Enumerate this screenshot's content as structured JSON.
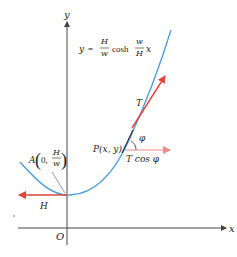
{
  "figure": {
    "type": "catenary-tension-diagram",
    "axes": {
      "x_label": "x",
      "y_label": "y",
      "origin_label": "O"
    },
    "equation": {
      "lhs": "y",
      "equals": "=",
      "frac1_num": "H",
      "frac1_den": "w",
      "func": "cosh",
      "frac2_num": "w",
      "frac2_den": "H",
      "var": "x"
    },
    "point_A": {
      "name": "A",
      "open": "(",
      "x": "0,",
      "frac_num": "H",
      "frac_den": "w",
      "close": ")"
    },
    "point_P": {
      "label": "P(x, y)"
    },
    "vectors": {
      "tension_label": "T",
      "horizontal_component_label": "T cos φ",
      "angle_label": "φ",
      "H_label": "H"
    },
    "colors": {
      "curve": "#4a9ad8",
      "vector": "#e0443a",
      "vector_light": "#ee8a84",
      "axis": "#444444",
      "leader": "#555555"
    }
  }
}
